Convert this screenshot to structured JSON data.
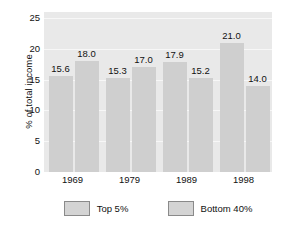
{
  "chart_data": {
    "type": "bar",
    "title": "",
    "xlabel": "",
    "ylabel": "% of total income",
    "categories": [
      "1969",
      "1979",
      "1989",
      "1998"
    ],
    "series": [
      {
        "name": "Top 5%",
        "values": [
          15.6,
          18.0,
          17.9,
          21.0
        ]
      },
      {
        "name": "Bottom 40%",
        "values": [
          18.0,
          17.0,
          15.2,
          14.0
        ]
      }
    ],
    "bar_labels": [
      [
        "15.6",
        "18.0"
      ],
      [
        "15.3",
        "17.0"
      ],
      [
        "17.9",
        "15.2"
      ],
      [
        "21.0",
        "14.0"
      ]
    ],
    "grouped_values": [
      [
        15.6,
        18.0
      ],
      [
        15.3,
        17.0
      ],
      [
        17.9,
        15.2
      ],
      [
        21.0,
        14.0
      ]
    ],
    "ylim": [
      0,
      26
    ],
    "yticks": [
      0,
      5,
      10,
      15,
      20,
      25
    ],
    "ytick_labels": [
      "0",
      "5",
      "10",
      "15",
      "20",
      "25"
    ],
    "grid": true,
    "legend_position": "bottom",
    "colors": {
      "plot_background": "#e9e9e9",
      "bar_fill": "#cfcfcf",
      "gridline": "#f7f7f7",
      "text": "#111111",
      "legend_border": "#8a8a8a",
      "legend_fill": "#d4d4d4",
      "page_background": "#ffffff"
    }
  },
  "legend": {
    "items": [
      {
        "label": "Top 5%"
      },
      {
        "label": "Bottom 40%"
      }
    ]
  }
}
